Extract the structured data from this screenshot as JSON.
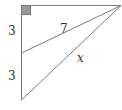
{
  "diagram": {
    "type": "geometry-right-triangle",
    "colors": {
      "stroke": "#7a7a7a",
      "right_angle_fill": "#9a9a9a",
      "right_angle_stroke": "#777777",
      "label": "#333333",
      "background": "#ffffff"
    },
    "vertices": {
      "top_left": [
        21,
        5
      ],
      "top_right": [
        121,
        5
      ],
      "mid_left": [
        21,
        53
      ],
      "bottom_left": [
        21,
        100
      ]
    },
    "labels": {
      "upper_left_segment": "3",
      "lower_left_segment": "3",
      "upper_hypotenuse": "7",
      "lower_hypotenuse": "x"
    },
    "right_angle_marker": {
      "x": 21,
      "y": 5,
      "size": 9
    }
  }
}
